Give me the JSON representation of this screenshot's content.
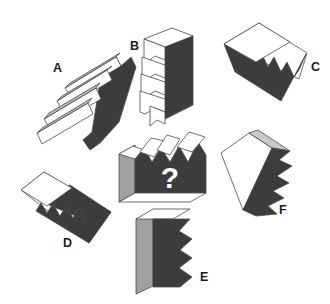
{
  "puzzle": {
    "type": "spatial-reasoning-multiple-choice",
    "canvas": {
      "width": 330,
      "height": 304,
      "background": "#ffffff"
    },
    "prompt_symbol": "?",
    "colors": {
      "background": "#ffffff",
      "dark_face": "#3c3c3c",
      "mid_gray_face": "#a0a0a0",
      "light_face": "#ffffff",
      "outline": "#4a4a4a",
      "label_text": "#1b1b1b",
      "question_text": "#ffffff"
    },
    "target": {
      "name": "question-shape",
      "label": "?",
      "description": "Gray-sided block with sawtooth zigzag top edge and dark front face",
      "teeth_count": 4
    },
    "options": [
      {
        "id": "A",
        "label": "A",
        "label_x": 53,
        "label_y": 72,
        "description": "Tilted stack of zigzag plates with dark wedge face, rotated about -35 degrees",
        "teeth_count": 4
      },
      {
        "id": "B",
        "label": "B",
        "label_x": 130,
        "label_y": 50,
        "description": "Upright block of stacked zigzag plates, dark right face",
        "teeth_count": 5
      },
      {
        "id": "C",
        "label": "C",
        "label_x": 311,
        "label_y": 71,
        "description": "Flat slab tilted right, dark face with row of white triangular teeth",
        "teeth_count": 4
      },
      {
        "id": "D",
        "label": "D",
        "label_x": 63,
        "label_y": 247,
        "description": "Flat slab tilted right-down, dark face with row of white triangular teeth",
        "teeth_count": 4
      },
      {
        "id": "E",
        "label": "E",
        "label_x": 200,
        "label_y": 281,
        "description": "Upright block, light-gray left face, dark front face with zigzag right edge",
        "teeth_count": 5
      },
      {
        "id": "F",
        "label": "F",
        "label_x": 279,
        "label_y": 214,
        "description": "Tilted block, white front face, dark sawtooth right face",
        "teeth_count": 5
      }
    ]
  }
}
